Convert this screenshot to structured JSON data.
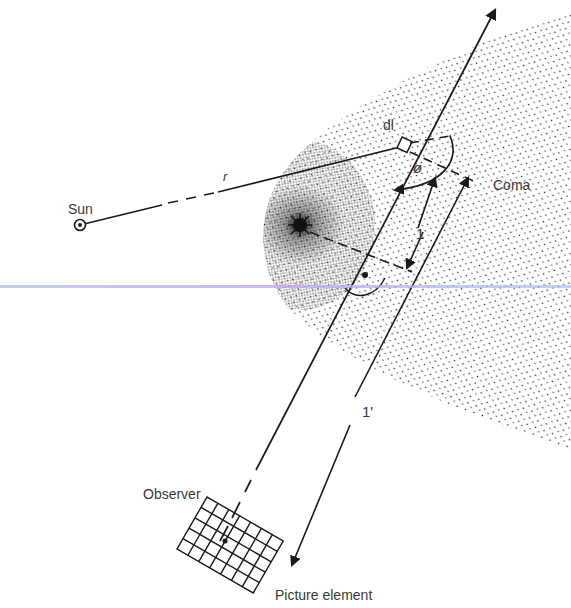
{
  "diagram": {
    "type": "comet coma line-of-sight geometry",
    "labels": {
      "sun": "Sun",
      "r": "r",
      "dl": "dl",
      "phi": "ø",
      "coma": "Coma",
      "l": "1",
      "l_prime": "1'",
      "observer": "Observer",
      "picture_element": "Picture element"
    },
    "colors": {
      "ink": "#1a1a1a",
      "label": "#3a3a3a",
      "background": "#ffffff",
      "scan_artifact": "#b4b9eb"
    },
    "grid": {
      "columns": 7,
      "rows": 5
    }
  }
}
